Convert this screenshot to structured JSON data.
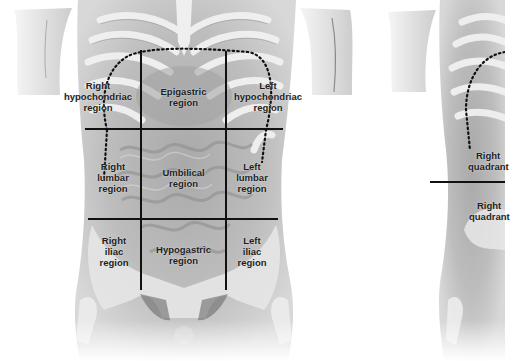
{
  "figures": [
    {
      "name": "nine-regions",
      "regions": [
        {
          "id": "right-hypochondriac",
          "lines": [
            "Right",
            "hypochondriac",
            "region"
          ]
        },
        {
          "id": "epigastric",
          "lines": [
            "Epigastric",
            "region"
          ]
        },
        {
          "id": "left-hypochondriac",
          "lines": [
            "Left",
            "hypochondriac",
            "region"
          ]
        },
        {
          "id": "right-lumbar",
          "lines": [
            "Right",
            "lumbar",
            "region"
          ]
        },
        {
          "id": "umbilical",
          "lines": [
            "Umbilical",
            "region"
          ]
        },
        {
          "id": "left-lumbar",
          "lines": [
            "Left",
            "lumbar",
            "region"
          ]
        },
        {
          "id": "right-iliac",
          "lines": [
            "Right",
            "iliac",
            "region"
          ]
        },
        {
          "id": "hypogastric",
          "lines": [
            "Hypogastric",
            "region"
          ]
        },
        {
          "id": "left-iliac",
          "lines": [
            "Left",
            "iliac",
            "region"
          ]
        }
      ]
    },
    {
      "name": "four-quadrants-partial",
      "regions": [
        {
          "id": "right-upper-quadrant",
          "lines": [
            "Right",
            "quadrant"
          ]
        },
        {
          "id": "right-lower-quadrant",
          "lines": [
            "Right",
            "quadrant"
          ]
        }
      ]
    }
  ],
  "colors": {
    "grid_line": "#111111",
    "label_text": "#1e1e1e",
    "skin": "#c9c9c9",
    "bone": "#ececec"
  }
}
